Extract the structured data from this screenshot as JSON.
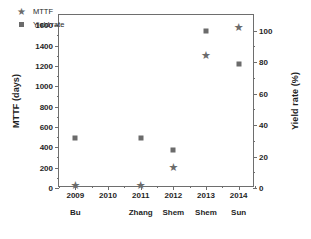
{
  "chart_data": {
    "type": "scatter",
    "title": "",
    "xlabel": "",
    "ylabel": "MTTF (days)",
    "y2label": "Yield rate (%)",
    "grid": false,
    "legend_position": "top-left",
    "x": [
      2009,
      2010,
      2011,
      2012,
      2013,
      2014
    ],
    "x_tick_labels": [
      "2009",
      "2010",
      "2011",
      "2012",
      "2013",
      "2014"
    ],
    "x_author_labels": [
      "Bu",
      "",
      "Zhang",
      "Shem",
      "Shem",
      "Sun"
    ],
    "xlim": [
      2008.5,
      2014.5
    ],
    "ylim": [
      0,
      1700
    ],
    "y_tick_labels": [
      "0",
      "200",
      "400",
      "600",
      "800",
      "1000",
      "1200",
      "1400",
      "1600"
    ],
    "y_ticks": [
      0,
      200,
      400,
      600,
      800,
      1000,
      1200,
      1400,
      1600
    ],
    "y2lim": [
      0,
      110
    ],
    "y2_tick_labels": [
      "0",
      "20",
      "40",
      "60",
      "80",
      "100"
    ],
    "y2_ticks": [
      0,
      20,
      40,
      60,
      80,
      100
    ],
    "series": [
      {
        "name": "MTTF",
        "marker": "star",
        "axis": "left",
        "color": "#6b6b6b",
        "points": [
          {
            "x": 2009,
            "y": 20
          },
          {
            "x": 2011,
            "y": 20
          },
          {
            "x": 2012,
            "y": 200
          },
          {
            "x": 2013,
            "y": 1300
          },
          {
            "x": 2014,
            "y": 1570
          }
        ]
      },
      {
        "name": "Yield rate",
        "marker": "square",
        "axis": "right",
        "color": "#6b6b6b",
        "points": [
          {
            "x": 2009,
            "y": 32
          },
          {
            "x": 2011,
            "y": 32
          },
          {
            "x": 2012,
            "y": 24
          },
          {
            "x": 2013,
            "y": 100
          },
          {
            "x": 2014,
            "y": 79
          }
        ]
      }
    ]
  },
  "legend": {
    "items": [
      {
        "label": "MTTF",
        "marker": "star"
      },
      {
        "label": "Yield rate",
        "marker": "square"
      }
    ]
  }
}
